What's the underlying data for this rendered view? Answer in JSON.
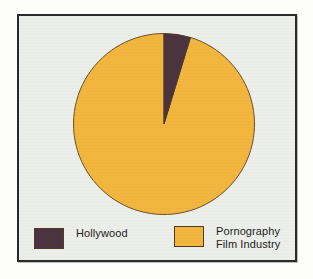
{
  "figure": {
    "background_color": "#eceeea",
    "frame_color": "#2a2a2c",
    "page_color": "#fdfdfb"
  },
  "legend": {
    "entries": [
      {
        "label": "Hollywood",
        "color": "#4b3340",
        "swatch_name": "legend-swatch-hollywood"
      },
      {
        "label": "Pornography\nFilm Industry",
        "color": "#f2b63f",
        "swatch_name": "legend-swatch-pornography"
      }
    ]
  },
  "chart_data": {
    "type": "pie",
    "title": "",
    "subtitle": "",
    "xlabel": "",
    "ylabel": "",
    "legend_position": "bottom",
    "grid": false,
    "start_angle_deg": 0,
    "direction": "clockwise",
    "categories": [
      "Hollywood",
      "Pornography Film Industry"
    ],
    "values": [
      5,
      95
    ],
    "value_unit": "percent",
    "slices": [
      {
        "label": "Hollywood",
        "value": 5,
        "angle_deg": 17,
        "color": "#4b3340",
        "edge_color": "#4d3b26"
      },
      {
        "label": "Pornography Film Industry",
        "value": 95,
        "angle_deg": 343,
        "color": "#f2b63f",
        "edge_color": "#6b4f2a"
      }
    ]
  }
}
